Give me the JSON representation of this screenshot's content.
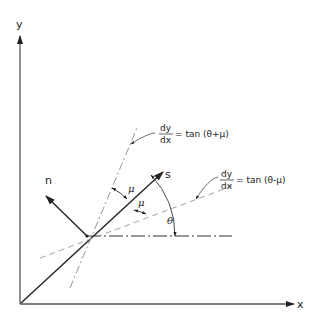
{
  "figure": {
    "type": "characteristics-diagram",
    "axes": {
      "x_label": "x",
      "y_label": "y"
    },
    "vectors": {
      "streamline_label": "s",
      "normal_label": "n"
    },
    "angles": {
      "theta": "θ",
      "mu_upper": "μ",
      "mu_lower": "μ"
    },
    "characteristics": [
      {
        "id": "plus",
        "numerator": "dy",
        "denominator": "dx",
        "rhs": "= tan (θ+μ)",
        "line_style": "dash-dot"
      },
      {
        "id": "minus",
        "numerator": "dy",
        "denominator": "dx",
        "rhs": "= tan (θ-μ)",
        "line_style": "dashed"
      }
    ],
    "colors": {
      "ink": "#222222",
      "construction": "#888888",
      "background": "#ffffff"
    }
  }
}
